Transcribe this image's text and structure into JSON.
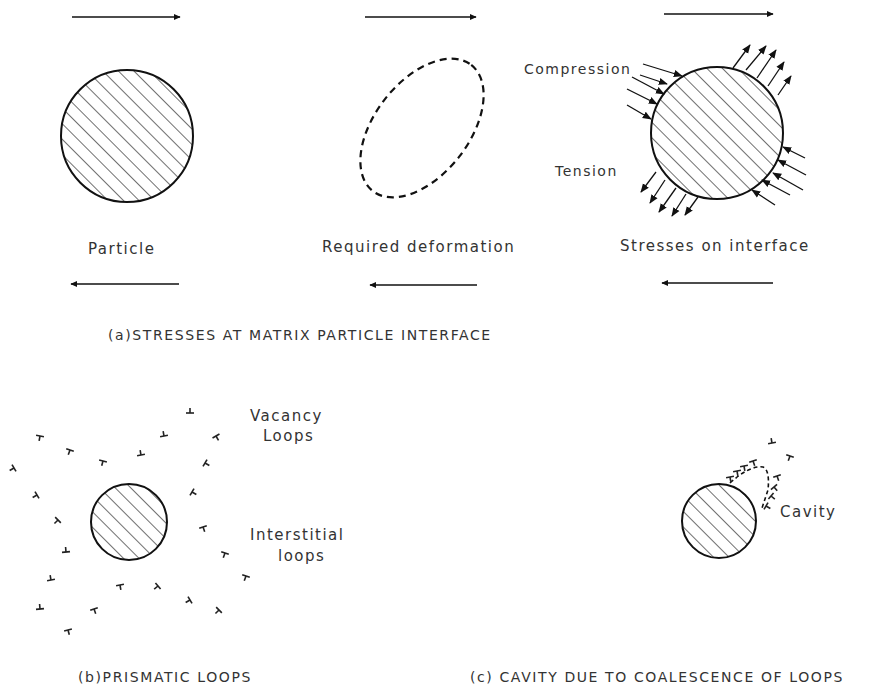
{
  "panel_a": {
    "caption": "(a)STRESSES AT MATRIX PARTICLE INTERFACE",
    "particle_label": "Particle",
    "deformation_label": "Required deformation",
    "stresses_label": "Stresses on interface",
    "compression_label": "Compression",
    "tension_label": "Tension"
  },
  "panel_b": {
    "caption": "(b)PRISMATIC LOOPS",
    "vacancy_label_line1": "Vacancy",
    "vacancy_label_line2": "Loops",
    "interstitial_label_line1": "Interstitial",
    "interstitial_label_line2": "loops"
  },
  "panel_c": {
    "caption": "(c) CAVITY  DUE TO COALESCENCE OF LOOPS",
    "cavity_label": "Cavity"
  },
  "colors": {
    "ink": "#1a1a1a",
    "background": "#ffffff"
  }
}
